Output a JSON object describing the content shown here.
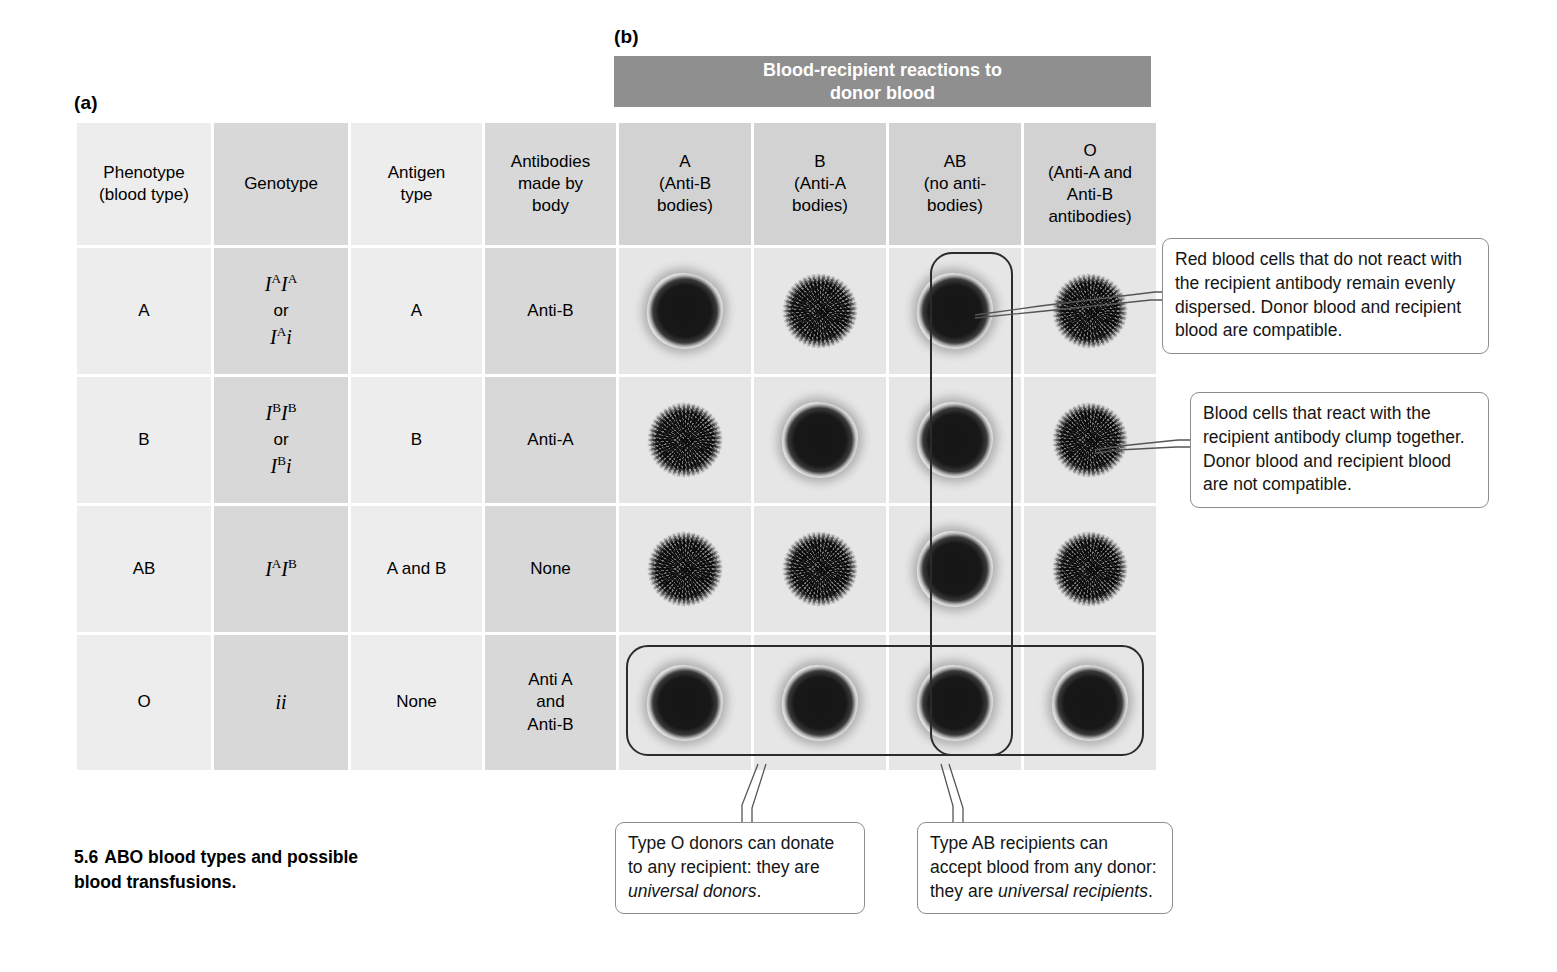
{
  "figure": {
    "panel_a_label": "(a)",
    "panel_b_label": "(b)",
    "caption_number": "5.6",
    "caption_text": "ABO blood types and possible blood transfusions."
  },
  "banner": {
    "line1": "Blood-recipient reactions to",
    "line2": "donor blood"
  },
  "table": {
    "headers": {
      "phenotype": {
        "line1": "Phenotype",
        "line2": "(blood type)"
      },
      "genotype": {
        "line1": "Genotype"
      },
      "antigen": {
        "line1": "Antigen",
        "line2": "type"
      },
      "antibodies": {
        "line1": "Antibodies",
        "line2": "made by",
        "line3": "body"
      },
      "donor_a": {
        "line1": "A",
        "line2": "(Anti-B",
        "line3": "bodies)"
      },
      "donor_b": {
        "line1": "B",
        "line2": "(Anti-A",
        "line3": "bodies)"
      },
      "donor_ab": {
        "line1": "AB",
        "line2": "(no anti-",
        "line3": "bodies)"
      },
      "donor_o": {
        "line1": "O",
        "line2": "(Anti-A and",
        "line3": "Anti-B",
        "line4": "antibodies)"
      }
    },
    "rows": [
      {
        "phenotype": "A",
        "genotype_plain": "IAIA or IAi",
        "genotype": {
          "line1_base": "I",
          "line1_sup": "A",
          "line1_base2": "I",
          "line1_sup2": "A",
          "or": "or",
          "line2_base": "I",
          "line2_sup": "A",
          "line2_tail": "i"
        },
        "antigen": "A",
        "antibodies": "Anti-B",
        "reactions": [
          "compatible",
          "clumped",
          "compatible",
          "clumped"
        ]
      },
      {
        "phenotype": "B",
        "genotype_plain": "IBIB or IBi",
        "genotype": {
          "line1_base": "I",
          "line1_sup": "B",
          "line1_base2": "I",
          "line1_sup2": "B",
          "or": "or",
          "line2_base": "I",
          "line2_sup": "B",
          "line2_tail": "i"
        },
        "antigen": "B",
        "antibodies": "Anti-A",
        "reactions": [
          "clumped",
          "compatible",
          "compatible",
          "clumped"
        ]
      },
      {
        "phenotype": "AB",
        "genotype_plain": "IAIB",
        "genotype": {
          "line1_base": "I",
          "line1_sup": "A",
          "line1_base2": "I",
          "line1_sup2": "B",
          "or": "",
          "line2_base": "",
          "line2_sup": "",
          "line2_tail": ""
        },
        "antigen": "A and B",
        "antibodies": "None",
        "reactions": [
          "clumped",
          "clumped",
          "compatible",
          "clumped"
        ]
      },
      {
        "phenotype": "O",
        "genotype_plain": "ii",
        "genotype": {
          "line1_base": "ii",
          "line1_sup": "",
          "line1_base2": "",
          "line1_sup2": "",
          "or": "",
          "line2_base": "",
          "line2_sup": "",
          "line2_tail": ""
        },
        "antigen": "None",
        "antibodies_multiline": {
          "line1": "Anti A",
          "line2": "and",
          "line3": "Anti-B"
        },
        "reactions": [
          "compatible",
          "compatible",
          "compatible",
          "compatible"
        ]
      }
    ]
  },
  "callouts": {
    "compatible": "Red blood cells that do not react with the recipient antibody remain evenly dispersed. Donor blood and recipient blood are compatible.",
    "incompatible": "Blood cells that react with the recipient antibody clump together. Donor blood and recipient blood are not compatible.",
    "o_donor_pre": "Type O donors can donate to any recipient: they are ",
    "o_donor_em": "universal donors",
    "o_donor_post": ".",
    "ab_recipient_pre": "Type AB recipients can accept blood from any donor: they are ",
    "ab_recipient_em": "universal recipients",
    "ab_recipient_post": "."
  },
  "colors": {
    "banner_bg": "#8f8f8f",
    "banner_text": "#ffffff",
    "column_light": "#ededed",
    "column_dark": "#d8d8d8",
    "highlight_stroke": "#2b2b2b",
    "callout_border": "#8c8c8c",
    "spot_compatible": "#181818",
    "spot_clumped": "#9d9d9d"
  }
}
